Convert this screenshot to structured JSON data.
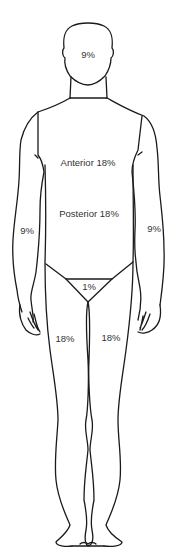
{
  "diagram": {
    "type": "body-surface-area-rule-of-nines",
    "view": "front",
    "line_color": "#1a1a1a",
    "text_color": "#333333",
    "background": "#ffffff",
    "regions": [
      {
        "id": "head",
        "label": "9%",
        "x": 88,
        "y": 55
      },
      {
        "id": "trunk-anterior",
        "label": "Anterior 18%",
        "x": 88,
        "y": 163
      },
      {
        "id": "trunk-posterior",
        "label": "Posterior 18%",
        "x": 89,
        "y": 214
      },
      {
        "id": "right-arm",
        "label": "9%",
        "x": 27,
        "y": 231
      },
      {
        "id": "left-arm",
        "label": "9%",
        "x": 154,
        "y": 229
      },
      {
        "id": "perineum",
        "label": "1%",
        "x": 89,
        "y": 287
      },
      {
        "id": "right-leg",
        "label": "18%",
        "x": 65,
        "y": 339
      },
      {
        "id": "left-leg",
        "label": "18%",
        "x": 111,
        "y": 338
      }
    ]
  }
}
